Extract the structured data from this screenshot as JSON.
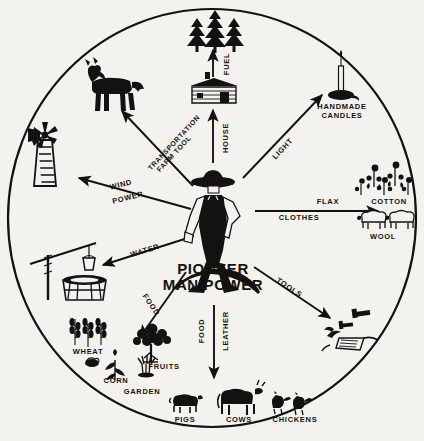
{
  "diagram": {
    "title": "PIONEER MAN POWER",
    "center": {
      "line1": "PIONEER",
      "line2": "MAN POWER"
    },
    "ink_color": "#141210",
    "paper_color": "#f3f2ee",
    "spokes": [
      {
        "name": "fuel",
        "label": "FUEL",
        "direction": "up",
        "target": "pine-trees"
      },
      {
        "name": "house",
        "label": "HOUSE",
        "direction": "up",
        "target": "log-cabin"
      },
      {
        "name": "light",
        "label": "LIGHT",
        "direction": "up-right",
        "target": "handmade-candles"
      },
      {
        "name": "clothes",
        "label": "CLOTHES",
        "direction": "right",
        "target": "flax-cotton-wool"
      },
      {
        "name": "tools",
        "label": "TOOLS",
        "direction": "down-right",
        "target": "hand-tools-plow"
      },
      {
        "name": "food-leather",
        "label_food": "FOOD",
        "label_leather": "LEATHER",
        "direction": "down",
        "target": "livestock"
      },
      {
        "name": "food",
        "label": "FOOD",
        "direction": "down-left",
        "target": "crops"
      },
      {
        "name": "water",
        "label": "WATER",
        "direction": "left-down",
        "target": "well"
      },
      {
        "name": "wind-power",
        "label_line1": "WIND",
        "label_line2": "POWER",
        "direction": "left",
        "target": "windmill"
      },
      {
        "name": "transportation",
        "label_line1": "TRANSPORTATION",
        "label_line2": "FARM TOOL",
        "direction": "up-left",
        "target": "horse"
      }
    ],
    "resource_labels": [
      {
        "name": "handmade-candles",
        "line1": "HANDMADE",
        "line2": "CANDLES"
      },
      {
        "name": "flax",
        "text": "FLAX"
      },
      {
        "name": "cotton",
        "text": "COTTON"
      },
      {
        "name": "wool",
        "text": "WOOL"
      },
      {
        "name": "wheat",
        "text": "WHEAT"
      },
      {
        "name": "corn",
        "text": "CORN"
      },
      {
        "name": "garden",
        "text": "GARDEN"
      },
      {
        "name": "fruits",
        "text": "FRUITS"
      },
      {
        "name": "pigs",
        "text": "PIGS"
      },
      {
        "name": "cows",
        "text": "COWS"
      },
      {
        "name": "chickens",
        "text": "CHICKENS"
      }
    ],
    "icons": [
      {
        "name": "pine-trees-icon",
        "meaning": "fuel"
      },
      {
        "name": "log-cabin-icon",
        "meaning": "house"
      },
      {
        "name": "candle-icon",
        "meaning": "handmade candles"
      },
      {
        "name": "cotton-plants-icon",
        "meaning": "cotton"
      },
      {
        "name": "sheep-icon",
        "meaning": "wool"
      },
      {
        "name": "hammer-icon",
        "meaning": "tools"
      },
      {
        "name": "plow-icon",
        "meaning": "farm tool"
      },
      {
        "name": "pig-icon",
        "meaning": "pigs"
      },
      {
        "name": "cow-icon",
        "meaning": "cows"
      },
      {
        "name": "chicken-icon",
        "meaning": "chickens"
      },
      {
        "name": "fruit-tree-icon",
        "meaning": "fruits"
      },
      {
        "name": "corn-icon",
        "meaning": "corn"
      },
      {
        "name": "garden-plant-icon",
        "meaning": "garden"
      },
      {
        "name": "wheat-icon",
        "meaning": "wheat"
      },
      {
        "name": "well-icon",
        "meaning": "water well"
      },
      {
        "name": "windmill-icon",
        "meaning": "wind power"
      },
      {
        "name": "horse-icon",
        "meaning": "transportation"
      },
      {
        "name": "pioneer-figure-icon",
        "meaning": "pioneer man"
      }
    ]
  }
}
